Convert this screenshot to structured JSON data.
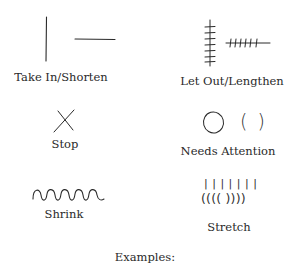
{
  "legend": {
    "items": [
      {
        "id": "take-in",
        "label": "Take In/Shorten",
        "symbol": "straight-line-icon"
      },
      {
        "id": "let-out",
        "label": "Let Out/Lengthen",
        "symbol": "hatched-line-icon"
      },
      {
        "id": "stop",
        "label": "Stop",
        "symbol": "x-mark-icon"
      },
      {
        "id": "needs-attention",
        "label": "Needs Attention",
        "symbol": "circle-parentheses-icon"
      },
      {
        "id": "shrink",
        "label": "Shrink",
        "symbol": "wavy-line-icon"
      },
      {
        "id": "stretch",
        "label": "Stretch",
        "symbol": "bars-parentheses-icon"
      }
    ],
    "needs_attention_parens": "(  )",
    "stretch_bars": "| | | | | | |",
    "stretch_parens": "(((( ))))"
  },
  "footer": {
    "caption": "Examples:"
  },
  "colors": {
    "stroke": "#2a2a2a",
    "background": "#ffffff"
  }
}
